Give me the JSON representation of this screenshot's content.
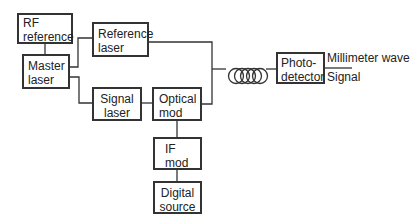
{
  "diagram": {
    "blocks": {
      "rf_reference": [
        "RF",
        "reference"
      ],
      "master_laser": [
        "Master",
        "laser"
      ],
      "reference_laser": [
        "Reference",
        "laser"
      ],
      "signal_laser": [
        "Signal",
        "laser"
      ],
      "optical_mod": [
        "Optical",
        "mod"
      ],
      "if_mod": [
        "IF",
        "mod"
      ],
      "digital_source": [
        "Digital",
        "source"
      ],
      "photodetector": [
        "Photo-",
        "detector"
      ]
    },
    "outputs": {
      "top": "Millimeter wave",
      "bottom": "Signal"
    },
    "fiber": "fiber-coil",
    "colors": {
      "line": "#333333",
      "background": "#ffffff"
    }
  }
}
